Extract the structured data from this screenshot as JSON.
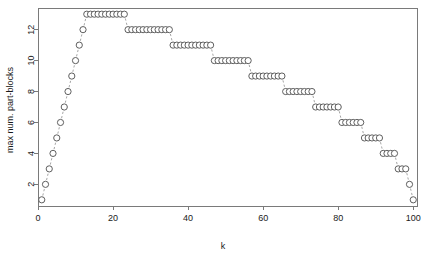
{
  "chart_data": {
    "type": "scatter",
    "title": "",
    "xlabel": "k",
    "ylabel": "max num. part-blocks",
    "xlim": [
      0,
      101
    ],
    "ylim": [
      0.6,
      13.4
    ],
    "xticks": [
      0,
      20,
      40,
      60,
      80,
      100
    ],
    "yticks": [
      2,
      4,
      6,
      8,
      10,
      12
    ],
    "grid": false,
    "legend": null,
    "marker": "open-circle",
    "connector": "dashed-line",
    "series": [
      {
        "name": "max num. part-blocks",
        "x": [
          1,
          2,
          3,
          4,
          5,
          6,
          7,
          8,
          9,
          10,
          11,
          12,
          13,
          14,
          15,
          16,
          17,
          18,
          19,
          20,
          21,
          22,
          23,
          24,
          25,
          26,
          27,
          28,
          29,
          30,
          31,
          32,
          33,
          34,
          35,
          36,
          37,
          38,
          39,
          40,
          41,
          42,
          43,
          44,
          45,
          46,
          47,
          48,
          49,
          50,
          51,
          52,
          53,
          54,
          55,
          56,
          57,
          58,
          59,
          60,
          61,
          62,
          63,
          64,
          65,
          66,
          67,
          68,
          69,
          70,
          71,
          72,
          73,
          74,
          75,
          76,
          77,
          78,
          79,
          80,
          81,
          82,
          83,
          84,
          85,
          86,
          87,
          88,
          89,
          90,
          91,
          92,
          93,
          94,
          95,
          96,
          97,
          98,
          99,
          100
        ],
        "values": [
          1,
          2,
          3,
          4,
          5,
          6,
          7,
          8,
          9,
          10,
          11,
          12,
          13,
          13,
          13,
          13,
          13,
          13,
          13,
          13,
          13,
          13,
          13,
          12,
          12,
          12,
          12,
          12,
          12,
          12,
          12,
          12,
          12,
          12,
          12,
          11,
          11,
          11,
          11,
          11,
          11,
          11,
          11,
          11,
          11,
          11,
          10,
          10,
          10,
          10,
          10,
          10,
          10,
          10,
          10,
          10,
          9,
          9,
          9,
          9,
          9,
          9,
          9,
          9,
          9,
          8,
          8,
          8,
          8,
          8,
          8,
          8,
          8,
          7,
          7,
          7,
          7,
          7,
          7,
          7,
          6,
          6,
          6,
          6,
          6,
          6,
          5,
          5,
          5,
          5,
          5,
          4,
          4,
          4,
          4,
          3,
          3,
          3,
          2,
          1
        ]
      }
    ]
  },
  "axes": {
    "x_tick_labels": [
      "0",
      "20",
      "40",
      "60",
      "80",
      "100"
    ],
    "y_tick_labels": [
      "2",
      "4",
      "6",
      "8",
      "10",
      "12"
    ],
    "x_axis_title": "k",
    "y_axis_title": "max num. part-blocks"
  },
  "style": {
    "background": "#ffffff",
    "axis_color": "#7a7a7a",
    "point_stroke": "#4d4d4d",
    "point_fill": "#ffffff",
    "line_color": "#8e8e8e",
    "text_color": "#1a1a1a"
  }
}
